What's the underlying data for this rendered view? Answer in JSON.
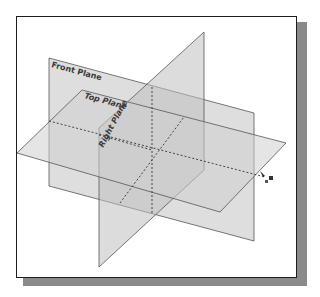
{
  "diagram": {
    "type": "reference-planes",
    "planes": [
      {
        "name": "Front Plane",
        "label": "Front Plane"
      },
      {
        "name": "Top Plane",
        "label": "Top Plane"
      },
      {
        "name": "Right Plane",
        "label": "Right Plane"
      }
    ],
    "colors": {
      "plane_fill": "#c8c8c8",
      "plane_edge": "#555555",
      "dashed_edge": "#333333",
      "frame_border": "#1e1e1e",
      "shadow": "#8a8a8a"
    },
    "cursor_icon": "rotate-cursor-icon"
  }
}
